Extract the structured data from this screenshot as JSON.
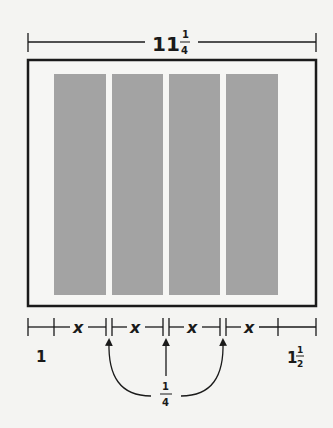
{
  "diagram": {
    "top_dimension": {
      "whole": "11",
      "numerator": "1",
      "denominator": "4"
    },
    "strips": {
      "count": 4,
      "fill": "#a3a3a3"
    },
    "bottom_segments": [
      "x",
      "x",
      "x",
      "x"
    ],
    "left_margin": "1",
    "right_margin": {
      "whole": "1",
      "numerator": "1",
      "denominator": "2"
    },
    "gap_label": {
      "numerator": "1",
      "denominator": "4"
    },
    "colors": {
      "line": "#1a1a1a",
      "strip": "#a3a3a3",
      "background": "#f4f4f2"
    }
  }
}
